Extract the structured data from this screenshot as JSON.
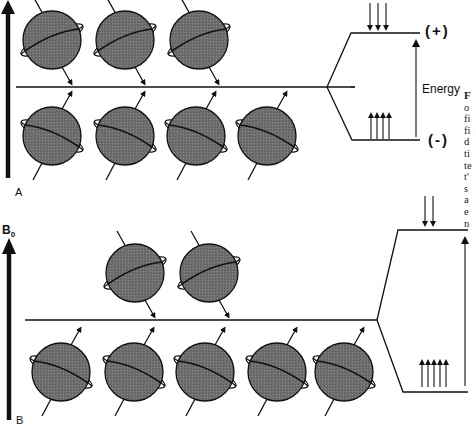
{
  "figure": {
    "colors": {
      "sphere_fill": "#6e6e6e",
      "line": "#111111",
      "background": "#ffffff"
    }
  },
  "panel_a": {
    "label": "A",
    "upper_row_count": 3,
    "lower_row_count": 4,
    "upper_state": {
      "label": "(+)",
      "spin_arrows": 3,
      "direction": "down"
    },
    "lower_state": {
      "label": "(-)",
      "spin_arrows": 4,
      "direction": "up"
    },
    "energy_label": "Energy"
  },
  "panel_b": {
    "label": "B",
    "field_label": "B",
    "field_subscript": "0",
    "upper_row_count": 2,
    "lower_row_count": 5,
    "upper_state": {
      "spin_arrows": 2,
      "direction": "down"
    },
    "lower_state": {
      "spin_arrows": 5,
      "direction": "up"
    }
  },
  "caption_fragment": [
    "F",
    "o",
    "fi",
    "fi",
    "d",
    "ti",
    "te",
    "t'",
    "s",
    "a",
    "e",
    "n"
  ]
}
